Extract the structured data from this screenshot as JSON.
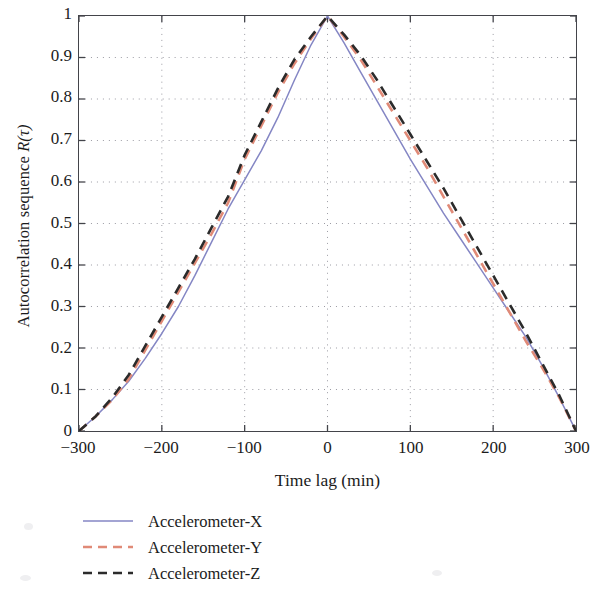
{
  "figure": {
    "background": "#ffffff",
    "frame_color": "#43444a",
    "grid_color": "#9a9aa2"
  },
  "axes": {
    "x": {
      "label": "Time lag (min)",
      "ticks": [
        "−300",
        "−200",
        "−100",
        "0",
        "100",
        "200",
        "300"
      ],
      "tick_values": [
        -300,
        -200,
        -100,
        0,
        100,
        200,
        300
      ],
      "min": -300,
      "max": 300
    },
    "y": {
      "label_prefix": "Autocorrelation sequence ",
      "label_symbol": "R",
      "label_arg": "(τ)",
      "label_full": "Autocorrelation sequence R(τ)",
      "ticks": [
        "0",
        "0.1",
        "0.2",
        "0.3",
        "0.4",
        "0.5",
        "0.6",
        "0.7",
        "0.8",
        "0.9",
        "1"
      ],
      "tick_values": [
        0,
        0.1,
        0.2,
        0.3,
        0.4,
        0.5,
        0.6,
        0.7,
        0.8,
        0.9,
        1
      ],
      "min": 0,
      "max": 1
    }
  },
  "legend": {
    "position": "below-left",
    "items": [
      {
        "label": "Accelerometer-X",
        "color": "#8486c4",
        "style": "solid"
      },
      {
        "label": "Accelerometer-Y",
        "color": "#e08a77",
        "style": "dashed"
      },
      {
        "label": "Accelerometer-Z",
        "color": "#2b2b2b",
        "style": "dashed"
      }
    ]
  },
  "chart_data": {
    "type": "line",
    "title": "",
    "xlabel": "Time lag (min)",
    "ylabel": "Autocorrelation sequence R(τ)",
    "xlim": [
      -300,
      300
    ],
    "ylim": [
      0,
      1
    ],
    "grid": true,
    "legend_position": "below-left",
    "x": [
      -300,
      -280,
      -260,
      -240,
      -220,
      -200,
      -180,
      -160,
      -140,
      -120,
      -100,
      -80,
      -60,
      -40,
      -20,
      0,
      20,
      40,
      60,
      80,
      100,
      120,
      140,
      160,
      180,
      200,
      220,
      240,
      260,
      280,
      300
    ],
    "series": [
      {
        "name": "Accelerometer-X",
        "color": "#8486c4",
        "style": "solid",
        "values": [
          0.0,
          0.035,
          0.075,
          0.12,
          0.175,
          0.235,
          0.3,
          0.375,
          0.455,
          0.535,
          0.605,
          0.675,
          0.755,
          0.845,
          0.93,
          1.0,
          0.935,
          0.865,
          0.795,
          0.725,
          0.655,
          0.59,
          0.525,
          0.465,
          0.405,
          0.345,
          0.285,
          0.225,
          0.155,
          0.08,
          0.0
        ]
      },
      {
        "name": "Accelerometer-Y",
        "color": "#e08a77",
        "style": "dashed",
        "values": [
          0.0,
          0.035,
          0.075,
          0.125,
          0.195,
          0.265,
          0.335,
          0.405,
          0.475,
          0.55,
          0.655,
          0.735,
          0.815,
          0.885,
          0.945,
          1.0,
          0.95,
          0.895,
          0.83,
          0.765,
          0.7,
          0.635,
          0.565,
          0.495,
          0.425,
          0.355,
          0.285,
          0.215,
          0.15,
          0.08,
          0.0
        ]
      },
      {
        "name": "Accelerometer-Z",
        "color": "#2b2b2b",
        "style": "dashed",
        "values": [
          0.0,
          0.035,
          0.08,
          0.135,
          0.205,
          0.275,
          0.345,
          0.415,
          0.49,
          0.565,
          0.665,
          0.745,
          0.825,
          0.895,
          0.95,
          1.0,
          0.955,
          0.905,
          0.845,
          0.78,
          0.715,
          0.65,
          0.585,
          0.515,
          0.445,
          0.375,
          0.305,
          0.235,
          0.16,
          0.085,
          0.0
        ]
      }
    ]
  }
}
